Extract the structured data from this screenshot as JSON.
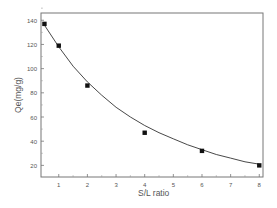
{
  "chart_data": {
    "type": "scatter",
    "title": "",
    "xlabel": "S/L ratio",
    "ylabel": "Qe(mg/g)",
    "xlim": [
      0.38,
      8.13
    ],
    "ylim": [
      10.4,
      146
    ],
    "xticks": [
      1,
      2,
      3,
      4,
      5,
      6,
      7,
      8
    ],
    "yticks": [
      20,
      40,
      60,
      80,
      100,
      120,
      140
    ],
    "grid": false,
    "legend": null,
    "series": [
      {
        "name": "data",
        "marker": "square",
        "x": [
          0.5,
          1,
          2,
          4,
          6,
          8
        ],
        "y": [
          137,
          119,
          86,
          47,
          32,
          20
        ]
      },
      {
        "name": "fit",
        "style": "line",
        "x": [
          0.5,
          1,
          1.5,
          2,
          2.5,
          3,
          3.5,
          4,
          4.5,
          5,
          5.5,
          6,
          6.5,
          7,
          7.5,
          8
        ],
        "y": [
          136,
          118,
          102,
          89,
          78,
          68,
          60,
          53,
          47,
          42,
          37,
          33,
          29,
          26,
          23,
          21
        ]
      }
    ],
    "colors": {
      "axis": "#666666",
      "marker": "#111111",
      "line": "#333333"
    }
  }
}
